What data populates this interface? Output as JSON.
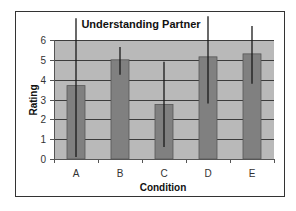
{
  "chart_data": {
    "type": "bar",
    "title": "Understanding Partner",
    "xlabel": "Condition",
    "ylabel": "Rating",
    "categories": [
      "A",
      "B",
      "C",
      "D",
      "E"
    ],
    "values": [
      3.7,
      5.0,
      2.75,
      5.15,
      5.3
    ],
    "error_bars": [
      {
        "low": 0.1,
        "high": 7.1
      },
      {
        "low": 4.25,
        "high": 5.65
      },
      {
        "low": 0.6,
        "high": 4.9
      },
      {
        "low": 2.8,
        "high": 7.2
      },
      {
        "low": 3.8,
        "high": 6.7
      }
    ],
    "ylim": [
      0,
      6
    ],
    "yticks": [
      0,
      1,
      2,
      3,
      4,
      5,
      6
    ],
    "grid": true,
    "legend": "none",
    "colors": {
      "plot_background": "#b9b9b9",
      "bar": "#808080",
      "bar_edge": "#555555",
      "gridline": "#3c3c3c",
      "error_bar": "#1a1a1a",
      "frame": "#333333"
    }
  }
}
